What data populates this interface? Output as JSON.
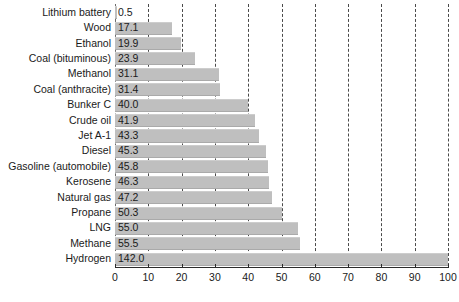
{
  "chart_data": {
    "type": "bar",
    "orientation": "horizontal",
    "title": "",
    "subtitle": "",
    "xlabel": "",
    "ylabel": "",
    "xlim": [
      0,
      100
    ],
    "xticks": [
      0,
      10,
      20,
      30,
      40,
      50,
      60,
      70,
      80,
      90,
      100
    ],
    "xtick_labels": [
      "0",
      "10",
      "20",
      "30",
      "40",
      "50",
      "60",
      "70",
      "80",
      "90",
      "100"
    ],
    "grid": "vertical-dashed",
    "legend": "none",
    "bar_color": "#bfbfbf",
    "text_color": "#1a1a1a",
    "gridline_color": "#4a4a4a",
    "axis_color": "#2b2b2b",
    "background": "#ffffff",
    "note": "Hydrogen bar value 142.0 exceeds axis maximum and is clipped at 100",
    "categories": [
      "Lithium battery",
      "Wood",
      "Ethanol",
      "Coal (bituminous)",
      "Methanol",
      "Coal (anthracite)",
      "Bunker C",
      "Crude oil",
      "Jet A-1",
      "Diesel",
      "Gasoline (automobile)",
      "Kerosene",
      "Natural gas",
      "Propane",
      "LNG",
      "Methane",
      "Hydrogen"
    ],
    "values": [
      0.5,
      17.1,
      19.9,
      23.9,
      31.1,
      31.4,
      40.0,
      41.9,
      43.3,
      45.3,
      45.8,
      46.3,
      47.2,
      50.3,
      55.0,
      55.5,
      142.0
    ],
    "value_labels": [
      "0.5",
      "17.1",
      "19.9",
      "23.9",
      "31.1",
      "31.4",
      "40.0",
      "41.9",
      "43.3",
      "45.3",
      "45.8",
      "46.3",
      "47.2",
      "50.3",
      "55.0",
      "55.5",
      "142.0"
    ]
  }
}
